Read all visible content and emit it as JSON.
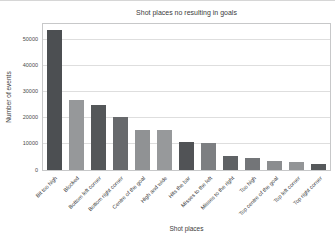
{
  "chart_data": {
    "type": "bar",
    "title": "Shot places no resulting in goals",
    "xlabel": "Shot places",
    "ylabel": "Number of events",
    "categories": [
      "Bit too high",
      "Blocked",
      "Bottom left corner",
      "Bottom right corner",
      "Centre of the goal",
      "High and wide",
      "Hits the bar",
      "Misses to the left",
      "Misses to the right",
      "Too high",
      "Top centre of the goal",
      "Top left corner",
      "Top right corner"
    ],
    "values": [
      54000,
      27000,
      25000,
      20400,
      15300,
      15300,
      10900,
      10200,
      5400,
      4600,
      3300,
      3000,
      2300
    ],
    "bar_colors": [
      "#4c4f52",
      "#96989a",
      "#545759",
      "#67696c",
      "#909294",
      "#97999b",
      "#515356",
      "#7d7f82",
      "#5f6265",
      "#737578",
      "#8b8d8f",
      "#939597",
      "#56595b"
    ],
    "yticks": [
      0,
      10000,
      20000,
      30000,
      40000,
      50000
    ],
    "ylim": [
      0,
      56150
    ],
    "grid": "horizontal",
    "legend": "none"
  },
  "colors": {
    "background": "#ffffff",
    "grid": "#dedede",
    "spine": "#c7c8c9",
    "text": "#3b3b3b"
  }
}
